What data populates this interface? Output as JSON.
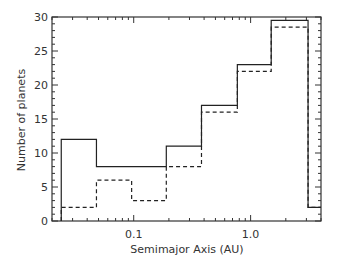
{
  "chart_data": {
    "type": "histogram-step",
    "title": "",
    "xlabel": "Semimajor Axis (AU)",
    "ylabel": "Number of planets",
    "xscale": "log",
    "xlim": [
      0.02,
      4.0
    ],
    "ylim": [
      0,
      30
    ],
    "x_ticks_major": [
      {
        "value": 0.1,
        "label": "0.1"
      },
      {
        "value": 1.0,
        "label": "1.0"
      }
    ],
    "y_ticks_major": [
      {
        "value": 0,
        "label": "0"
      },
      {
        "value": 5,
        "label": "5"
      },
      {
        "value": 10,
        "label": "10"
      },
      {
        "value": 15,
        "label": "15"
      },
      {
        "value": 20,
        "label": "20"
      },
      {
        "value": 25,
        "label": "25"
      },
      {
        "value": 30,
        "label": "30"
      }
    ],
    "bin_edges": [
      0.024,
      0.048,
      0.096,
      0.19,
      0.38,
      0.77,
      1.5,
      3.1,
      4.0
    ],
    "series": [
      {
        "name": "solid",
        "style": "solid",
        "values": [
          12,
          8,
          8,
          11,
          17,
          23,
          29.5,
          2
        ]
      },
      {
        "name": "dashed",
        "style": "dashed",
        "values": [
          2,
          6,
          3,
          8,
          16,
          22,
          28.5,
          2
        ]
      }
    ],
    "grid": false,
    "legend": null
  }
}
